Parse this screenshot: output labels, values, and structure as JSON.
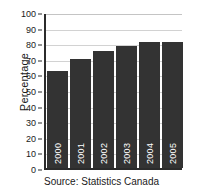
{
  "chart_data": {
    "type": "bar",
    "title": "",
    "subtitle": "",
    "xlabel": "",
    "ylabel": "Percentage",
    "categories": [
      "2000",
      "2001",
      "2002",
      "2003",
      "2004",
      "2005"
    ],
    "values": [
      62,
      70,
      75,
      78,
      81,
      81
    ],
    "ylim": [
      0,
      100
    ],
    "yticks": [
      0,
      10,
      20,
      30,
      40,
      50,
      60,
      70,
      80,
      90,
      100
    ],
    "ytick_labels": [
      "0",
      "10",
      "20",
      "30",
      "40",
      "50",
      "60",
      "70",
      "80",
      "90",
      "100"
    ],
    "grid": true,
    "grid_axis": "y",
    "legend": false,
    "legend_position": "none",
    "bar_color": "#333333",
    "bar_label_color": "#ffffff",
    "gridline_color": "#d2d2d2",
    "axis_color": "#2b2b2b",
    "annotations": []
  },
  "caption": {
    "source": "Source: Statistics Canada"
  }
}
